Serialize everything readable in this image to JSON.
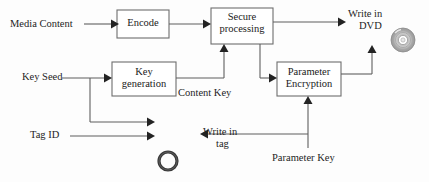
{
  "diagram": {
    "type": "block-flow-diagram",
    "background_color": "#fdfdfd",
    "line_color": "#5f5f5f",
    "text_color": "#1d1d1d",
    "box_fill": "#ffffff",
    "box_stroke": "#6e6e6e",
    "boxes": [
      {
        "id": "encode",
        "label": "Encode",
        "x": 117,
        "y": 10,
        "w": 52,
        "h": 28
      },
      {
        "id": "secure-processing",
        "label_line1": "Secure",
        "label_line2": "processing",
        "x": 211,
        "y": 8,
        "w": 62,
        "h": 36
      },
      {
        "id": "key-generation",
        "label_line1": "Key",
        "label_line2": "generation",
        "x": 112,
        "y": 62,
        "w": 64,
        "h": 34
      },
      {
        "id": "parameter-encryption",
        "label_line1": "Parameter",
        "label_line2": "Encryption",
        "x": 277,
        "y": 62,
        "w": 64,
        "h": 34
      }
    ],
    "labels": [
      {
        "id": "media-content",
        "text": "Media Content",
        "x": 10,
        "y": 18
      },
      {
        "id": "key-seed",
        "text": "Key Seed",
        "x": 22,
        "y": 71
      },
      {
        "id": "tag-id",
        "text": "Tag ID",
        "x": 30,
        "y": 128
      },
      {
        "id": "content-key",
        "text": "Content Key",
        "x": 178,
        "y": 86
      },
      {
        "id": "parameter-key",
        "text": "Parameter Key",
        "x": 272,
        "y": 152
      },
      {
        "id": "write-in-dvd-line1",
        "text": "Write in",
        "x": 348,
        "y": 8
      },
      {
        "id": "write-in-dvd-line2",
        "text": "DVD",
        "x": 358,
        "y": 20
      },
      {
        "id": "write-in-tag-line1",
        "text": "Write in",
        "x": 204,
        "y": 126
      },
      {
        "id": "write-in-tag-line2",
        "text": "tag",
        "x": 217,
        "y": 138
      }
    ],
    "icons": [
      {
        "id": "dvd-disc",
        "name": "dvd-disc-icon",
        "cx": 403,
        "cy": 40,
        "r": 12
      },
      {
        "id": "rfid-tag",
        "name": "rfid-tag-ring-icon",
        "cx": 168,
        "cy": 161,
        "r": 9
      }
    ],
    "connections": [
      {
        "id": "media-to-encode",
        "from": "media-content",
        "to": "encode"
      },
      {
        "id": "encode-to-secure",
        "from": "encode",
        "to": "secure-processing"
      },
      {
        "id": "secure-to-dvd",
        "from": "secure-processing",
        "to": "write-in-dvd"
      },
      {
        "id": "keyseed-to-keygen",
        "from": "key-seed",
        "to": "key-generation"
      },
      {
        "id": "keygen-to-secure",
        "from": "key-generation",
        "to": "secure-processing",
        "label": "Content Key"
      },
      {
        "id": "keyseed-to-writetag",
        "from": "key-seed",
        "to": "write-in-tag"
      },
      {
        "id": "tagid-to-writetag",
        "from": "tag-id",
        "to": "write-in-tag"
      },
      {
        "id": "secure-to-paramenc",
        "from": "secure-processing",
        "to": "parameter-encryption"
      },
      {
        "id": "paramenc-to-dvd",
        "from": "parameter-encryption",
        "to": "write-in-dvd"
      },
      {
        "id": "paramkey-to-paramenc",
        "from": "parameter-key",
        "to": "parameter-encryption"
      },
      {
        "id": "paramkey-to-writetag",
        "from": "parameter-key",
        "to": "write-in-tag"
      }
    ]
  }
}
